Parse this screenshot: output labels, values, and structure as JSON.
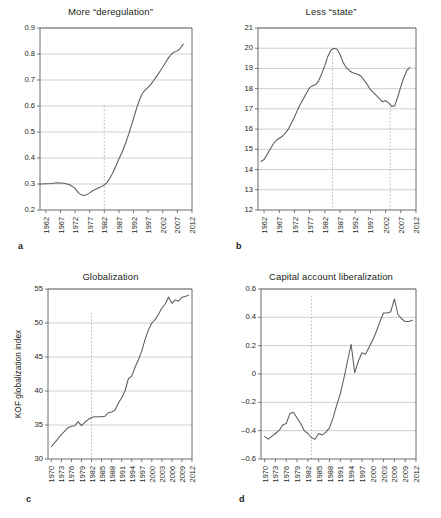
{
  "figure": {
    "panels": [
      {
        "letter": "a",
        "title": "More “deregulation”",
        "ylabel": "",
        "xticks": [
          1962,
          1967,
          1972,
          1977,
          1982,
          1987,
          1992,
          1997,
          2002,
          2007,
          2012
        ],
        "yticks": [
          0.2,
          0.3,
          0.4,
          0.5,
          0.6,
          0.7,
          0.8,
          0.9
        ],
        "xlim": [
          1960,
          2012
        ],
        "ylim": [
          0.2,
          0.9
        ],
        "ytick_format": "1dec",
        "event_lines": [
          {
            "x": 1982,
            "y_top": 0.6
          }
        ],
        "x": [
          1960,
          1962,
          1964,
          1966,
          1968,
          1970,
          1972,
          1973,
          1974,
          1975,
          1976,
          1977,
          1978,
          1979,
          1980,
          1981,
          1982,
          1983,
          1984,
          1985,
          1986,
          1987,
          1988,
          1989,
          1990,
          1991,
          1992,
          1993,
          1994,
          1995,
          1996,
          1997,
          1998,
          1999,
          2000,
          2001,
          2002,
          2003,
          2004,
          2005,
          2006,
          2007,
          2008,
          2009
        ],
        "y": [
          0.3,
          0.301,
          0.302,
          0.305,
          0.303,
          0.298,
          0.283,
          0.268,
          0.259,
          0.256,
          0.259,
          0.266,
          0.274,
          0.28,
          0.285,
          0.29,
          0.296,
          0.307,
          0.324,
          0.345,
          0.37,
          0.396,
          0.42,
          0.448,
          0.48,
          0.515,
          0.552,
          0.59,
          0.622,
          0.648,
          0.662,
          0.672,
          0.684,
          0.7,
          0.716,
          0.733,
          0.75,
          0.768,
          0.786,
          0.8,
          0.808,
          0.812,
          0.822,
          0.838
        ]
      },
      {
        "letter": "b",
        "title": "Less “state”",
        "ylabel": "",
        "xticks": [
          1962,
          1967,
          1972,
          1977,
          1982,
          1987,
          1992,
          1997,
          2002,
          2007,
          2012
        ],
        "yticks": [
          12,
          13,
          14,
          15,
          16,
          17,
          18,
          19,
          20,
          21
        ],
        "xlim": [
          1960,
          2012
        ],
        "ylim": [
          12,
          21
        ],
        "ytick_format": "int",
        "event_lines": [
          {
            "x": 1984.5,
            "y_top": 20.0
          },
          {
            "x": 2003.5,
            "y_top": 17.1
          }
        ],
        "x": [
          1961,
          1962,
          1963,
          1964,
          1965,
          1966,
          1967,
          1968,
          1969,
          1970,
          1971,
          1972,
          1973,
          1974,
          1975,
          1976,
          1977,
          1978,
          1979,
          1980,
          1981,
          1982,
          1983,
          1984,
          1985,
          1986,
          1987,
          1988,
          1989,
          1990,
          1991,
          1992,
          1993,
          1994,
          1995,
          1996,
          1997,
          1998,
          1999,
          2000,
          2001,
          2002,
          2003,
          2004,
          2005,
          2006,
          2007,
          2008,
          2009,
          2010
        ],
        "y": [
          14.4,
          14.5,
          14.75,
          15.0,
          15.25,
          15.45,
          15.55,
          15.65,
          15.8,
          16.0,
          16.3,
          16.6,
          16.95,
          17.25,
          17.52,
          17.8,
          18.05,
          18.15,
          18.2,
          18.4,
          18.75,
          19.15,
          19.6,
          19.9,
          20.0,
          19.95,
          19.7,
          19.3,
          19.05,
          18.9,
          18.8,
          18.75,
          18.7,
          18.6,
          18.4,
          18.2,
          17.95,
          17.8,
          17.65,
          17.5,
          17.35,
          17.4,
          17.3,
          17.12,
          17.15,
          17.6,
          18.1,
          18.55,
          18.9,
          19.05
        ]
      },
      {
        "letter": "c",
        "title": "Globalization",
        "ylabel": "KOF globalization index",
        "xticks": [
          1970,
          1973,
          1976,
          1979,
          1982,
          1985,
          1988,
          1991,
          1994,
          1997,
          2000,
          2003,
          2006,
          2009,
          2012
        ],
        "yticks": [
          30,
          35,
          40,
          45,
          50,
          55
        ],
        "xlim": [
          1969,
          2012
        ],
        "ylim": [
          30,
          55
        ],
        "ytick_format": "int",
        "event_lines": [
          {
            "x": 1982,
            "y_top": 51.5
          }
        ],
        "x": [
          1970,
          1971,
          1972,
          1973,
          1974,
          1975,
          1976,
          1977,
          1978,
          1979,
          1980,
          1981,
          1982,
          1983,
          1984,
          1985,
          1986,
          1987,
          1988,
          1989,
          1990,
          1991,
          1992,
          1993,
          1994,
          1995,
          1996,
          1997,
          1998,
          1999,
          2000,
          2001,
          2002,
          2003,
          2004,
          2005,
          2006,
          2007,
          2008,
          2009,
          2010,
          2011
        ],
        "y": [
          31.8,
          32.4,
          33.0,
          33.6,
          34.1,
          34.6,
          34.8,
          34.9,
          35.5,
          34.9,
          35.4,
          35.8,
          36.1,
          36.2,
          36.2,
          36.2,
          36.3,
          36.8,
          36.9,
          37.2,
          38.2,
          39.0,
          40.0,
          41.8,
          42.2,
          43.5,
          44.6,
          45.9,
          47.6,
          49.0,
          50.0,
          50.5,
          51.3,
          52.2,
          52.8,
          53.8,
          52.9,
          53.4,
          53.2,
          53.8,
          53.9,
          54.1
        ]
      },
      {
        "letter": "d",
        "title": "Capital account liberalization",
        "ylabel": "",
        "xticks": [
          1970,
          1973,
          1976,
          1979,
          1982,
          1985,
          1988,
          1991,
          1994,
          1997,
          2000,
          2003,
          2006,
          2009,
          2012
        ],
        "yticks": [
          -0.6,
          -0.4,
          -0.2,
          0,
          0.2,
          0.4,
          0.6
        ],
        "xlim": [
          1969,
          2012
        ],
        "ylim": [
          -0.6,
          0.6
        ],
        "ytick_format": "1dec_signed",
        "event_lines": [
          {
            "x": 1983,
            "y_top": 0.55
          }
        ],
        "x": [
          1970,
          1971,
          1972,
          1973,
          1974,
          1975,
          1976,
          1977,
          1978,
          1979,
          1980,
          1981,
          1982,
          1983,
          1984,
          1985,
          1986,
          1987,
          1988,
          1989,
          1990,
          1991,
          1992,
          1993,
          1994,
          1995,
          1996,
          1997,
          1998,
          1999,
          2000,
          2001,
          2002,
          2003,
          2004,
          2005,
          2006,
          2007,
          2008,
          2009,
          2010,
          2011
        ],
        "y": [
          -0.44,
          -0.46,
          -0.44,
          -0.42,
          -0.4,
          -0.36,
          -0.35,
          -0.28,
          -0.27,
          -0.31,
          -0.35,
          -0.4,
          -0.42,
          -0.45,
          -0.46,
          -0.42,
          -0.43,
          -0.41,
          -0.38,
          -0.31,
          -0.22,
          -0.14,
          -0.03,
          0.09,
          0.21,
          0.01,
          0.09,
          0.15,
          0.14,
          0.19,
          0.24,
          0.3,
          0.37,
          0.43,
          0.43,
          0.44,
          0.53,
          0.42,
          0.39,
          0.37,
          0.37,
          0.38
        ]
      }
    ]
  }
}
